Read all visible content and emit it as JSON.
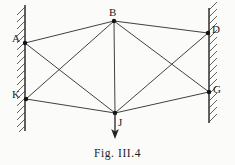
{
  "figure": {
    "caption": "Fig. III.4",
    "background_color": "#fbfbfa",
    "line_color": "#2b2b2b",
    "joint_color": "#141414"
  },
  "nodes": [
    {
      "id": "A",
      "label": "A",
      "x": 25,
      "y": 43,
      "label_x": 12,
      "label_y": 33
    },
    {
      "id": "B",
      "label": "B",
      "x": 114,
      "y": 21,
      "label_x": 109,
      "label_y": 7
    },
    {
      "id": "D",
      "label": "D",
      "x": 208,
      "y": 33,
      "label_x": 212,
      "label_y": 24
    },
    {
      "id": "G",
      "label": "G",
      "x": 209,
      "y": 92,
      "label_x": 213,
      "label_y": 84
    },
    {
      "id": "J",
      "label": "J",
      "x": 115,
      "y": 113,
      "label_x": 118,
      "label_y": 117
    },
    {
      "id": "K",
      "label": "K",
      "x": 26,
      "y": 99,
      "label_x": 12,
      "label_y": 89
    }
  ],
  "members": [
    {
      "from": "A",
      "to": "B"
    },
    {
      "from": "B",
      "to": "D"
    },
    {
      "from": "A",
      "to": "J"
    },
    {
      "from": "K",
      "to": "B"
    },
    {
      "from": "K",
      "to": "J"
    },
    {
      "from": "B",
      "to": "J"
    },
    {
      "from": "B",
      "to": "G"
    },
    {
      "from": "D",
      "to": "J"
    },
    {
      "from": "G",
      "to": "J"
    }
  ],
  "walls": [
    {
      "id": "left-wall",
      "x": 25,
      "y_top": 5,
      "y_bottom": 131,
      "hatch_side": "left"
    },
    {
      "id": "right-wall",
      "x": 209,
      "y_top": 8,
      "y_bottom": 123,
      "hatch_side": "right"
    }
  ],
  "load": {
    "at_node": "J",
    "direction": "down",
    "x": 115,
    "y_start": 113,
    "y_end": 139
  }
}
